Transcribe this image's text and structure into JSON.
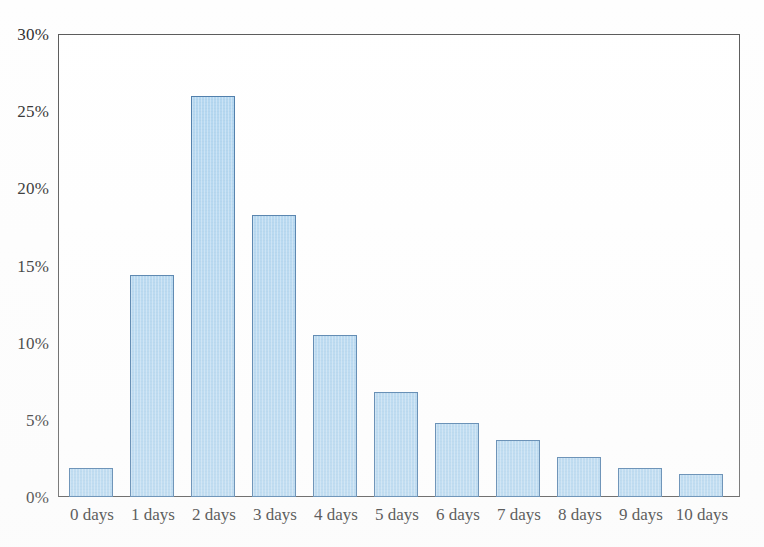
{
  "chart_data": {
    "type": "bar",
    "title": "",
    "subtitle": "",
    "xlabel": "",
    "ylabel": "",
    "categories": [
      "0 days",
      "1 days",
      "2 days",
      "3 days",
      "4 days",
      "5 days",
      "6 days",
      "7 days",
      "8 days",
      "9 days",
      "10 days"
    ],
    "values": [
      1.9,
      14.4,
      26.0,
      18.3,
      10.5,
      6.8,
      4.8,
      3.7,
      2.6,
      1.9,
      1.5
    ],
    "value_labels": [
      "1.9%",
      "14.4%",
      "26.0%",
      "18.3%",
      "10.5%",
      "6.8%",
      "4.8%",
      "3.7%",
      "2.6%",
      "1.9%",
      "1.5%"
    ],
    "ylim": [
      0,
      30
    ],
    "ytick_values": [
      0,
      5,
      10,
      15,
      20,
      25,
      30
    ],
    "ytick_labels": [
      "0%",
      "5%",
      "10%",
      "15%",
      "20%",
      "25%",
      "30%"
    ],
    "grid": false,
    "legend": false,
    "legend_position": "none",
    "bar_fill_color": "#b2d6f0",
    "bar_border_color": "#4a7aa8",
    "axis_color": "#4a4a4a",
    "background_color": "#ffffff"
  }
}
